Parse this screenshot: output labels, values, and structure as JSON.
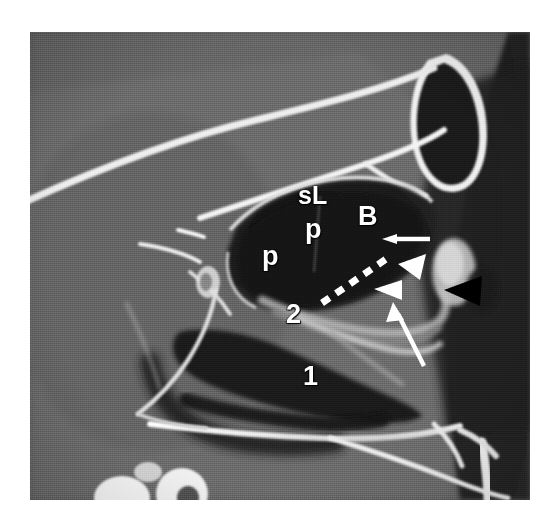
{
  "figure": {
    "modality": "CT",
    "plane": "sagittal",
    "region": "paranasal sinuses / skull base",
    "background_color": "#ffffff",
    "plate": {
      "x": 30,
      "y": 32,
      "width": 500,
      "height": 468
    }
  },
  "annotations": {
    "labels": [
      {
        "id": "label-sl",
        "text": "sL",
        "x": 298,
        "y": 183,
        "size": 25
      },
      {
        "id": "label-p-upper",
        "text": "p",
        "x": 305,
        "y": 216,
        "size": 27
      },
      {
        "id": "label-p-lower",
        "text": "p",
        "x": 262,
        "y": 243,
        "size": 27
      },
      {
        "id": "label-b",
        "text": "B",
        "x": 358,
        "y": 203,
        "size": 27
      },
      {
        "id": "label-2",
        "text": "2",
        "x": 286,
        "y": 301,
        "size": 27
      },
      {
        "id": "label-1",
        "text": "1",
        "x": 303,
        "y": 363,
        "size": 27
      }
    ],
    "markers": [
      {
        "id": "dashed-line",
        "kind": "dashed-line",
        "color": "#ffffff",
        "description": "dashed white line along posterior sphenoid wall"
      },
      {
        "id": "arrow-horizontal",
        "kind": "arrow",
        "color": "#ffffff",
        "direction": "left",
        "description": "short horizontal arrow"
      },
      {
        "id": "arrow-long",
        "kind": "arrow",
        "color": "#ffffff",
        "direction": "up-left",
        "description": "long oblique arrow"
      },
      {
        "id": "arrowhead-white-upper",
        "kind": "arrowhead",
        "color": "#ffffff",
        "direction": "down-left"
      },
      {
        "id": "arrowhead-white-lower",
        "kind": "arrowhead",
        "color": "#ffffff",
        "direction": "left"
      },
      {
        "id": "arrowhead-black",
        "kind": "arrowhead",
        "color": "#000000",
        "direction": "left"
      }
    ]
  },
  "palette": {
    "page": "#ffffff",
    "soft_tissue": "#6e6e6e",
    "air": "#1a1a1a",
    "bone": "#f2f2f2",
    "marker_white": "#ffffff",
    "marker_black": "#000000"
  }
}
